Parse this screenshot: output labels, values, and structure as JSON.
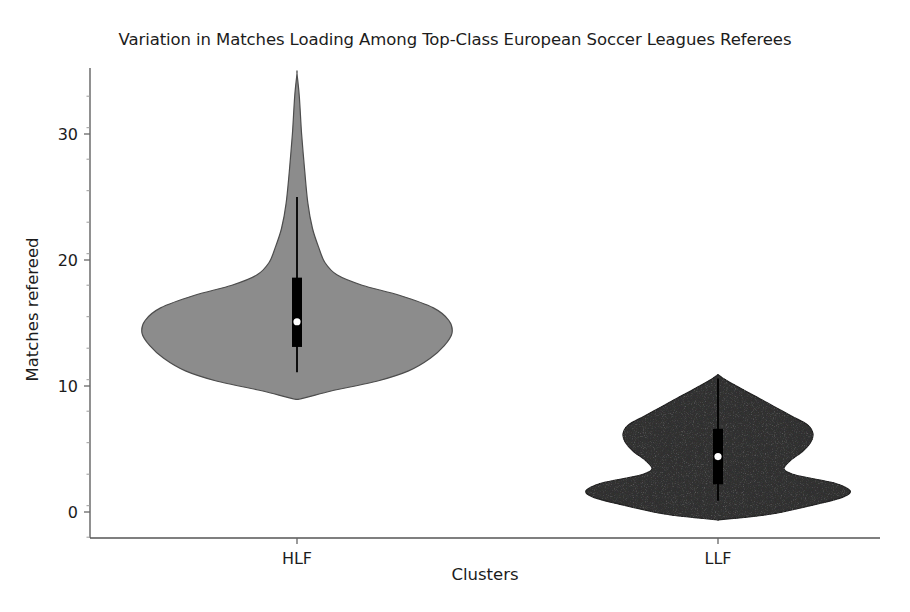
{
  "chart_data": {
    "type": "violin",
    "title": "Variation in Matches Loading Among Top-Class European Soccer Leagues Referees",
    "xlabel": "Clusters",
    "ylabel": "Matches refereed",
    "categories": [
      "HLF",
      "LLF"
    ],
    "ylim": [
      -2.5,
      35.5
    ],
    "yticks": [
      0,
      10,
      20,
      30
    ],
    "ytick_labels": [
      "0",
      "10",
      "20",
      "30"
    ],
    "minor_ticks": true,
    "grid": false,
    "legend": "none",
    "series": [
      {
        "name": "HLF",
        "fill_color": "#8c8c8c",
        "edge_color": "#4d4d4d",
        "median": 15.1,
        "q1": 13.1,
        "q3": 18.6,
        "whisker_low": 11.1,
        "whisker_high": 25.0,
        "data_min": 9.0,
        "data_max": 34.8,
        "mode": 15.0,
        "density_profile": [
          {
            "y": 9.0,
            "w": 0.03
          },
          {
            "y": 9.6,
            "w": 0.22
          },
          {
            "y": 10.4,
            "w": 0.52
          },
          {
            "y": 11.2,
            "w": 0.72
          },
          {
            "y": 12.2,
            "w": 0.86
          },
          {
            "y": 13.2,
            "w": 0.95
          },
          {
            "y": 14.2,
            "w": 1.0
          },
          {
            "y": 15.2,
            "w": 0.98
          },
          {
            "y": 16.2,
            "w": 0.88
          },
          {
            "y": 17.2,
            "w": 0.66
          },
          {
            "y": 18.0,
            "w": 0.42
          },
          {
            "y": 18.8,
            "w": 0.26
          },
          {
            "y": 19.8,
            "w": 0.18
          },
          {
            "y": 21.0,
            "w": 0.14
          },
          {
            "y": 22.5,
            "w": 0.1
          },
          {
            "y": 24.5,
            "w": 0.07
          },
          {
            "y": 27.0,
            "w": 0.05
          },
          {
            "y": 30.0,
            "w": 0.03
          },
          {
            "y": 33.0,
            "w": 0.015
          },
          {
            "y": 34.8,
            "w": 0.0
          }
        ]
      },
      {
        "name": "LLF",
        "fill_color": "#333333",
        "edge_color": "#262626",
        "median": 4.4,
        "q1": 2.2,
        "q3": 6.6,
        "whisker_low": 0.9,
        "whisker_high": 10.6,
        "data_min": -0.6,
        "data_max": 10.9,
        "mode": 1.6,
        "density_profile": [
          {
            "y": -0.6,
            "w": 0.02
          },
          {
            "y": -0.2,
            "w": 0.38
          },
          {
            "y": 0.6,
            "w": 0.74
          },
          {
            "y": 1.2,
            "w": 0.95
          },
          {
            "y": 1.7,
            "w": 1.0
          },
          {
            "y": 2.3,
            "w": 0.88
          },
          {
            "y": 2.9,
            "w": 0.6
          },
          {
            "y": 3.4,
            "w": 0.5
          },
          {
            "y": 4.1,
            "w": 0.55
          },
          {
            "y": 4.8,
            "w": 0.64
          },
          {
            "y": 5.5,
            "w": 0.7
          },
          {
            "y": 6.2,
            "w": 0.72
          },
          {
            "y": 6.9,
            "w": 0.68
          },
          {
            "y": 7.6,
            "w": 0.56
          },
          {
            "y": 8.4,
            "w": 0.42
          },
          {
            "y": 9.2,
            "w": 0.28
          },
          {
            "y": 10.0,
            "w": 0.14
          },
          {
            "y": 10.6,
            "w": 0.04
          },
          {
            "y": 10.9,
            "w": 0.0
          }
        ]
      }
    ]
  },
  "axes": {
    "spine_color": "#555555",
    "tick_color": "#666666",
    "background": "#ffffff"
  }
}
